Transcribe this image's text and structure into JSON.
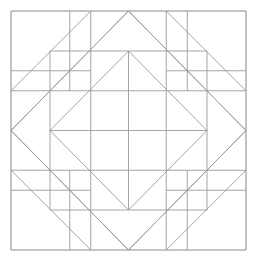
{
  "figure": {
    "title": "Quilt Block Line Drawing",
    "background_color": "#ffffff",
    "line_color": "#9a9a9a",
    "frame_color": "#8c8c8c",
    "line_width": 0.9,
    "canvas": {
      "width": 255,
      "height": 263
    },
    "geometry": {
      "frame": {
        "left": 11,
        "top": 11,
        "right": 246,
        "bottom": 250,
        "width": 235,
        "height": 239
      },
      "grid": {
        "columns": 4,
        "rows": 4,
        "x_positions": [
          11,
          69.75,
          128.5,
          187.25,
          246
        ],
        "y_positions": [
          11,
          70.75,
          130.5,
          190.25,
          250
        ]
      },
      "center": {
        "x": 128.5,
        "y": 130.5
      },
      "inner_square": {
        "left": 50,
        "top": 51,
        "right": 207,
        "bottom": 210
      },
      "diamond": {
        "top": [
          128.5,
          51
        ],
        "right": [
          207,
          130.5
        ],
        "bottom": [
          128.5,
          210
        ],
        "left": [
          50,
          130.5
        ]
      },
      "outer_diamond": {
        "top": [
          128.5,
          11
        ],
        "right": [
          246,
          130.5
        ],
        "bottom": [
          128.5,
          250
        ],
        "left": [
          11,
          130.5
        ]
      }
    }
  },
  "chart_data": {
    "type": "line",
    "title": "Quilt Block Line Drawing",
    "xlabel": "",
    "ylabel": "",
    "xlim": [
      0,
      255
    ],
    "ylim": [
      0,
      263
    ],
    "grid": false,
    "legend": "none",
    "segments": [
      {
        "name": "frame-top",
        "x": [
          11,
          246
        ],
        "y": [
          11,
          11
        ]
      },
      {
        "name": "frame-right",
        "x": [
          246,
          246
        ],
        "y": [
          11,
          250
        ]
      },
      {
        "name": "frame-bottom",
        "x": [
          11,
          246
        ],
        "y": [
          250,
          250
        ]
      },
      {
        "name": "frame-left",
        "x": [
          11,
          11
        ],
        "y": [
          11,
          250
        ]
      },
      {
        "name": "outer-diamond-tl",
        "x": [
          11,
          128.5
        ],
        "y": [
          130.5,
          11
        ]
      },
      {
        "name": "outer-diamond-tr",
        "x": [
          128.5,
          246
        ],
        "y": [
          11,
          130.5
        ]
      },
      {
        "name": "outer-diamond-br",
        "x": [
          246,
          128.5
        ],
        "y": [
          130.5,
          250
        ]
      },
      {
        "name": "outer-diamond-bl",
        "x": [
          128.5,
          11
        ],
        "y": [
          250,
          130.5
        ]
      },
      {
        "name": "inner-diamond-tl",
        "x": [
          50,
          128.5
        ],
        "y": [
          130.5,
          51
        ]
      },
      {
        "name": "inner-diamond-tr",
        "x": [
          128.5,
          207
        ],
        "y": [
          51,
          130.5
        ]
      },
      {
        "name": "inner-diamond-br",
        "x": [
          207,
          128.5
        ],
        "y": [
          130.5,
          210
        ]
      },
      {
        "name": "inner-diamond-bl",
        "x": [
          128.5,
          50
        ],
        "y": [
          210,
          130.5
        ]
      },
      {
        "name": "center-horizontal",
        "x": [
          50,
          207
        ],
        "y": [
          130.5,
          130.5
        ]
      },
      {
        "name": "center-vertical",
        "x": [
          128.5,
          128.5
        ],
        "y": [
          51,
          210
        ]
      },
      {
        "name": "inner-sq-top",
        "x": [
          50,
          207
        ],
        "y": [
          51,
          51
        ]
      },
      {
        "name": "inner-sq-right",
        "x": [
          207,
          207
        ],
        "y": [
          51,
          210
        ]
      },
      {
        "name": "inner-sq-bottom",
        "x": [
          50,
          207
        ],
        "y": [
          210,
          210
        ]
      },
      {
        "name": "inner-sq-left",
        "x": [
          50,
          50
        ],
        "y": [
          51,
          210
        ]
      },
      {
        "name": "grid-v-1-top",
        "x": [
          69.75,
          69.75
        ],
        "y": [
          11,
          90.75
        ]
      },
      {
        "name": "grid-v-3-top",
        "x": [
          187.25,
          187.25
        ],
        "y": [
          11,
          90.75
        ]
      },
      {
        "name": "grid-v-1-bot",
        "x": [
          69.75,
          69.75
        ],
        "y": [
          170.25,
          250
        ]
      },
      {
        "name": "grid-v-3-bot",
        "x": [
          187.25,
          187.25
        ],
        "y": [
          170.25,
          250
        ]
      },
      {
        "name": "grid-h-1-left",
        "x": [
          11,
          90.75
        ],
        "y": [
          70.75,
          70.75
        ]
      },
      {
        "name": "grid-h-1-right",
        "x": [
          166.25,
          246
        ],
        "y": [
          70.75,
          70.75
        ]
      },
      {
        "name": "grid-h-3-left",
        "x": [
          11,
          90.75
        ],
        "y": [
          190.25,
          190.25
        ]
      },
      {
        "name": "grid-h-3-right",
        "x": [
          166.25,
          246
        ],
        "y": [
          190.25,
          190.25
        ]
      },
      {
        "name": "corner-diag-tl",
        "x": [
          11,
          90.75
        ],
        "y": [
          90.75,
          11
        ]
      },
      {
        "name": "corner-diag-tr",
        "x": [
          166.25,
          246
        ],
        "y": [
          11,
          90.75
        ]
      },
      {
        "name": "corner-diag-br",
        "x": [
          246,
          166.25
        ],
        "y": [
          170.25,
          250
        ]
      },
      {
        "name": "corner-diag-bl",
        "x": [
          90.75,
          11
        ],
        "y": [
          250,
          170.25
        ]
      },
      {
        "name": "hst-diag-top-left",
        "x": [
          69.75,
          128.5
        ],
        "y": [
          70.75,
          11
        ]
      },
      {
        "name": "hst-diag-top-right",
        "x": [
          128.5,
          187.25
        ],
        "y": [
          11,
          70.75
        ]
      },
      {
        "name": "hst-diag-right-top",
        "x": [
          187.25,
          246
        ],
        "y": [
          70.75,
          130.5
        ]
      },
      {
        "name": "hst-diag-right-bot",
        "x": [
          246,
          187.25
        ],
        "y": [
          130.5,
          190.25
        ]
      },
      {
        "name": "hst-diag-bot-right",
        "x": [
          187.25,
          128.5
        ],
        "y": [
          190.25,
          250
        ]
      },
      {
        "name": "hst-diag-bot-left",
        "x": [
          128.5,
          69.75
        ],
        "y": [
          250,
          190.25
        ]
      },
      {
        "name": "hst-diag-left-bot",
        "x": [
          69.75,
          11
        ],
        "y": [
          190.25,
          130.5
        ]
      },
      {
        "name": "hst-diag-left-top",
        "x": [
          11,
          69.75
        ],
        "y": [
          130.5,
          70.75
        ]
      },
      {
        "name": "mid-sq-tl-v",
        "x": [
          90.75,
          90.75
        ],
        "y": [
          11,
          130.5
        ]
      },
      {
        "name": "mid-sq-tr-v",
        "x": [
          166.25,
          166.25
        ],
        "y": [
          11,
          130.5
        ]
      },
      {
        "name": "mid-sq-bl-v",
        "x": [
          90.75,
          90.75
        ],
        "y": [
          130.5,
          250
        ]
      },
      {
        "name": "mid-sq-br-v",
        "x": [
          166.25,
          166.25
        ],
        "y": [
          130.5,
          250
        ]
      },
      {
        "name": "mid-sq-tl-h",
        "x": [
          11,
          128.5
        ],
        "y": [
          90.75,
          90.75
        ]
      },
      {
        "name": "mid-sq-tr-h",
        "x": [
          128.5,
          246
        ],
        "y": [
          90.75,
          90.75
        ]
      },
      {
        "name": "mid-sq-bl-h",
        "x": [
          11,
          128.5
        ],
        "y": [
          170.25,
          170.25
        ]
      },
      {
        "name": "mid-sq-br-h",
        "x": [
          128.5,
          246
        ],
        "y": [
          170.25,
          170.25
        ]
      }
    ]
  }
}
